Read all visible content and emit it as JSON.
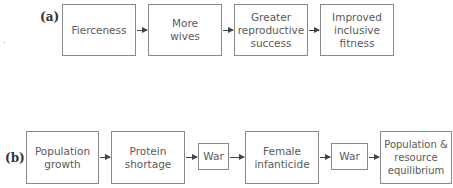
{
  "diagram": {
    "panel_a": {
      "label": "(a)",
      "nodes": [
        {
          "text": "Fierceness"
        },
        {
          "text": "More\nwives"
        },
        {
          "text": "Greater\nreproductive\nsuccess"
        },
        {
          "text": "Improved\ninclusive\nfitness"
        }
      ]
    },
    "panel_b": {
      "label": "(b)",
      "nodes": [
        {
          "text": "Population\ngrowth"
        },
        {
          "text": "Protein\nshortage"
        },
        {
          "text": "War"
        },
        {
          "text": "Female\ninfanticide"
        },
        {
          "text": "War"
        },
        {
          "text": "Population &\nresource\nequilibrium"
        }
      ]
    }
  }
}
